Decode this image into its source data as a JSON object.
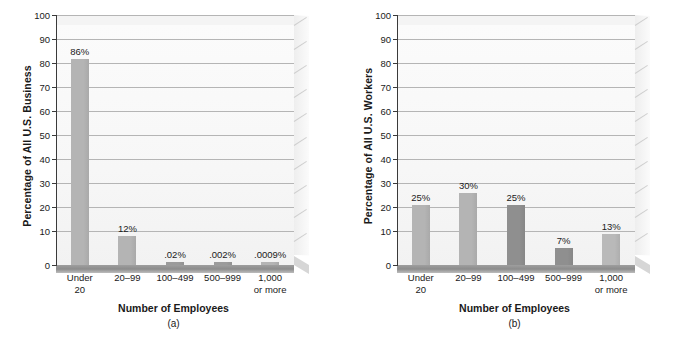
{
  "chart_data": [
    {
      "type": "bar",
      "panel": "(a)",
      "title": "",
      "xlabel": "Number of Employees",
      "ylabel": "Percentage of All U.S. Business",
      "ylim": [
        0,
        100
      ],
      "ytick_values": [
        0,
        10,
        20,
        30,
        40,
        50,
        60,
        70,
        80,
        90,
        100
      ],
      "ytick_labels": [
        "0",
        "10",
        "20",
        "30",
        "40",
        "50",
        "60",
        "70",
        "80",
        "90",
        "100"
      ],
      "grid": true,
      "legend": "none",
      "categories": [
        "Under 20",
        "20–99",
        "100–499",
        "500–999",
        "1,000 or more"
      ],
      "category_lines": [
        [
          "Under",
          "20"
        ],
        [
          "20–99",
          ""
        ],
        [
          "100–499",
          ""
        ],
        [
          "500–999",
          ""
        ],
        [
          "1,000",
          "or more"
        ]
      ],
      "values": [
        86,
        12,
        0.02,
        0.002,
        0.0009
      ],
      "data_labels": [
        "86%",
        "12%",
        ".02%",
        ".002%",
        ".0009%"
      ],
      "bar_colors": [
        "#b4b4b4",
        "#b4b4b4",
        "#9b9b9b",
        "#9b9b9b",
        "#b4b4b4"
      ]
    },
    {
      "type": "bar",
      "panel": "(b)",
      "title": "",
      "xlabel": "Number of Employees",
      "ylabel": "Percentage of All U.S. Workers",
      "ylim": [
        0,
        100
      ],
      "ytick_values": [
        0,
        10,
        20,
        30,
        40,
        50,
        60,
        70,
        80,
        90,
        100
      ],
      "ytick_labels": [
        "0",
        "10",
        "20",
        "30",
        "40",
        "50",
        "60",
        "70",
        "80",
        "90",
        "100"
      ],
      "grid": true,
      "legend": "none",
      "categories": [
        "Under 20",
        "20–99",
        "100–499",
        "500–999",
        "1,000 or more"
      ],
      "category_lines": [
        [
          "Under",
          "20"
        ],
        [
          "20–99",
          ""
        ],
        [
          "100–499",
          ""
        ],
        [
          "500–999",
          ""
        ],
        [
          "1,000",
          "or more"
        ]
      ],
      "values": [
        25,
        30,
        25,
        7,
        13
      ],
      "data_labels": [
        "25%",
        "30%",
        "25%",
        "7%",
        "13%"
      ],
      "bar_colors": [
        "#b4b4b4",
        "#b4b4b4",
        "#8f8f8f",
        "#8f8f8f",
        "#b9b9b9"
      ]
    }
  ],
  "colors": {
    "axis": "#3a3a3a",
    "gridline": "#b5b5b5",
    "plot_background": "#f8f8f8",
    "text": "#1a1a1a",
    "floor": "#8f8f8f"
  }
}
